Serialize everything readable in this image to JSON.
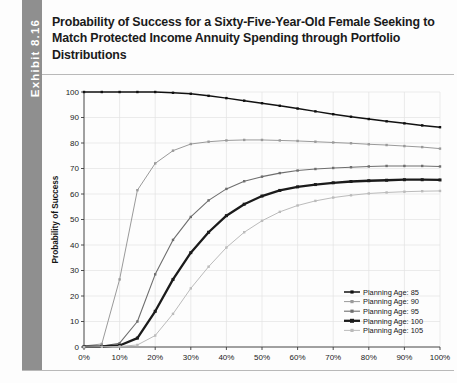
{
  "exhibit": {
    "label": "Exhibit 8.16"
  },
  "title": "Probability of Success for a Sixty-Five-Year-Old Female Seeking to Match Protected Income Annuity Spending through Portfolio Distributions",
  "chart_data": {
    "type": "line",
    "title": "",
    "xlabel": "Stock Allocation",
    "ylabel": "Probability of Success",
    "xlim": [
      0,
      100
    ],
    "ylim": [
      0,
      100
    ],
    "xtick_labels": [
      "0%",
      "10%",
      "20%",
      "30%",
      "40%",
      "50%",
      "60%",
      "70%",
      "80%",
      "90%",
      "100%"
    ],
    "xtick_values": [
      0,
      10,
      20,
      30,
      40,
      50,
      60,
      70,
      80,
      90,
      100
    ],
    "ytick_labels": [
      "0",
      "10",
      "20",
      "30",
      "40",
      "50",
      "60",
      "70",
      "80",
      "90",
      "100"
    ],
    "ytick_values": [
      0,
      10,
      20,
      30,
      40,
      50,
      60,
      70,
      80,
      90,
      100
    ],
    "grid": true,
    "legend_position": "lower right",
    "x": [
      0,
      5,
      10,
      15,
      20,
      25,
      30,
      35,
      40,
      45,
      50,
      55,
      60,
      65,
      70,
      75,
      80,
      85,
      90,
      95,
      100
    ],
    "series": [
      {
        "name": "Planning Age: 85",
        "color": "#111111",
        "width": 1.5,
        "marker": "square",
        "values": [
          100,
          100,
          100,
          100,
          100,
          99.7,
          99.3,
          98.5,
          97.6,
          96.6,
          95.6,
          94.6,
          93.5,
          92.4,
          91.3,
          90.3,
          89.4,
          88.5,
          87.7,
          86.9,
          86.2
        ]
      },
      {
        "name": "Planning Age: 90",
        "color": "#9a9a9a",
        "width": 1.0,
        "marker": "square",
        "values": [
          0.4,
          1.2,
          26.5,
          61.5,
          72.0,
          77.0,
          79.6,
          80.5,
          81.0,
          81.2,
          81.2,
          81.0,
          80.8,
          80.5,
          80.2,
          79.9,
          79.5,
          79.2,
          78.8,
          78.4,
          77.8
        ]
      },
      {
        "name": "Planning Age: 95",
        "color": "#6e6e6e",
        "width": 1.1,
        "marker": "square",
        "values": [
          0.2,
          0.4,
          1.5,
          10.0,
          28.5,
          42.0,
          51.0,
          57.5,
          62.0,
          65.0,
          66.8,
          68.2,
          69.2,
          69.8,
          70.2,
          70.5,
          70.8,
          71.0,
          71.0,
          71.0,
          70.8
        ]
      },
      {
        "name": "Planning Age: 100",
        "color": "#1b1b1b",
        "width": 2.3,
        "marker": "square",
        "values": [
          0.1,
          0.2,
          0.6,
          3.5,
          14.0,
          26.5,
          37.0,
          45.0,
          51.5,
          56.0,
          59.2,
          61.4,
          62.8,
          63.7,
          64.4,
          64.9,
          65.2,
          65.4,
          65.6,
          65.6,
          65.5
        ]
      },
      {
        "name": "Planning Age: 105",
        "color": "#bbbbbb",
        "width": 1.0,
        "marker": "square",
        "values": [
          0.0,
          0.1,
          0.2,
          0.8,
          4.5,
          13.0,
          23.0,
          31.5,
          39.0,
          45.0,
          49.5,
          53.0,
          55.5,
          57.3,
          58.6,
          59.5,
          60.2,
          60.6,
          60.9,
          61.1,
          61.2
        ]
      }
    ]
  }
}
